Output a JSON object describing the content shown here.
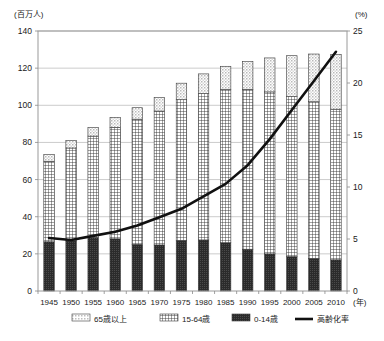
{
  "chart_data": {
    "type": "bar",
    "subtype": "stacked-bar-with-line",
    "title": "",
    "xlabel": "(年)",
    "ylabel": "(百万人)",
    "y2label": "(%)",
    "ylim": [
      0,
      140
    ],
    "y2lim": [
      0,
      25
    ],
    "yticks": [
      0,
      20,
      40,
      60,
      80,
      100,
      120,
      140
    ],
    "y2ticks": [
      0,
      5,
      10,
      15,
      20,
      25
    ],
    "grid": true,
    "legend_position": "bottom",
    "categories": [
      "1945",
      "1950",
      "1955",
      "1960",
      "1965",
      "1970",
      "1975",
      "1980",
      "1985",
      "1990",
      "1995",
      "2000",
      "2005",
      "2010"
    ],
    "series": [
      {
        "name": "0-14歳",
        "axis": "left",
        "pattern": "solid-dark",
        "color": "#2e2e2e",
        "values": [
          26.5,
          27.0,
          28.7,
          28.1,
          25.1,
          24.8,
          27.2,
          27.5,
          26.0,
          22.5,
          20.0,
          18.5,
          17.5,
          16.8
        ]
      },
      {
        "name": "15-64歳",
        "axis": "left",
        "pattern": "grid-hatch",
        "color": "#ffffff",
        "values": [
          43.3,
          50.0,
          54.7,
          60.0,
          67.4,
          72.1,
          75.8,
          78.8,
          82.5,
          86.1,
          87.2,
          86.2,
          84.4,
          81.1
        ]
      },
      {
        "name": "65歳以上",
        "axis": "left",
        "pattern": "light-dots",
        "color": "#d8d8d8",
        "values": [
          3.7,
          4.1,
          4.7,
          5.4,
          6.2,
          7.3,
          8.9,
          10.6,
          12.5,
          14.9,
          18.3,
          22.0,
          25.7,
          29.5
        ]
      }
    ],
    "line_series": {
      "name": "高齢化率",
      "axis": "right",
      "unit": "%",
      "color": "#111111",
      "values": [
        5.1,
        4.9,
        5.3,
        5.7,
        6.3,
        7.1,
        7.9,
        9.1,
        10.3,
        12.1,
        14.6,
        17.4,
        20.2,
        23.0
      ]
    }
  },
  "legend": {
    "items": [
      {
        "label": "65歳以上",
        "swatch": "light-dots"
      },
      {
        "label": "15-64歳",
        "swatch": "grid-hatch"
      },
      {
        "label": "0-14歳",
        "swatch": "solid-dark"
      },
      {
        "label": "高齢化率",
        "swatch": "line"
      }
    ]
  },
  "axes": {
    "left_unit": "(百万人)",
    "right_unit": "(%)",
    "x_unit": "(年)"
  }
}
